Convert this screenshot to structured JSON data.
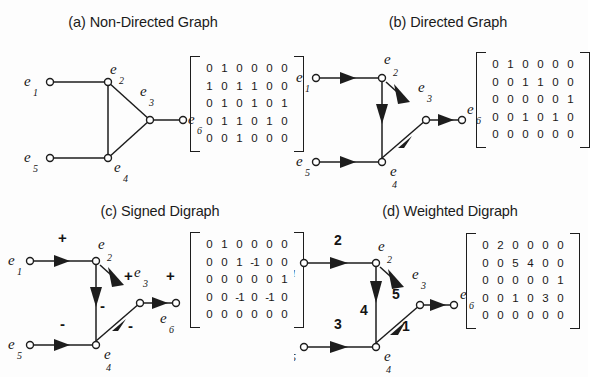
{
  "figure": {
    "background": "#fdfdfd",
    "stroke": "#1d1d1d",
    "panels": [
      {
        "id": "a",
        "title": "(a) Non-Directed Graph",
        "graph_type": "undirected",
        "nodes": [
          {
            "id": "e1",
            "label": "e",
            "sub": "1",
            "x": 50,
            "y": 52
          },
          {
            "id": "e2",
            "label": "e",
            "sub": "2",
            "x": 108,
            "y": 52
          },
          {
            "id": "e3",
            "label": "e",
            "sub": "3",
            "x": 150,
            "y": 90
          },
          {
            "id": "e4",
            "label": "e",
            "sub": "4",
            "x": 108,
            "y": 128
          },
          {
            "id": "e5",
            "label": "e",
            "sub": "5",
            "x": 50,
            "y": 128
          },
          {
            "id": "e6",
            "label": "e",
            "sub": "6",
            "x": 183,
            "y": 90
          }
        ],
        "edges": [
          {
            "from": "e1",
            "to": "e2",
            "label": ""
          },
          {
            "from": "e2",
            "to": "e3",
            "label": ""
          },
          {
            "from": "e2",
            "to": "e4",
            "label": ""
          },
          {
            "from": "e5",
            "to": "e4",
            "label": ""
          },
          {
            "from": "e4",
            "to": "e3",
            "label": ""
          },
          {
            "from": "e3",
            "to": "e6",
            "label": ""
          }
        ],
        "matrix": [
          [
            "0",
            "1",
            "0",
            "0",
            "0",
            "0"
          ],
          [
            "1",
            "0",
            "1",
            "1",
            "0",
            "0"
          ],
          [
            "0",
            "1",
            "0",
            "1",
            "0",
            "1"
          ],
          [
            "0",
            "1",
            "1",
            "0",
            "1",
            "0"
          ],
          [
            "0",
            "0",
            "1",
            "0",
            "0",
            "0"
          ]
        ]
      },
      {
        "id": "b",
        "title": "(b) Directed Graph",
        "graph_type": "directed",
        "nodes": [
          {
            "id": "e1",
            "label": "e",
            "sub": "1",
            "x": 22,
            "y": 48
          },
          {
            "id": "e2",
            "label": "e",
            "sub": "2",
            "x": 88,
            "y": 48
          },
          {
            "id": "e3",
            "label": "e",
            "sub": "3",
            "x": 132,
            "y": 90
          },
          {
            "id": "e4",
            "label": "e",
            "sub": "4",
            "x": 88,
            "y": 132
          },
          {
            "id": "e5",
            "label": "e",
            "sub": "5",
            "x": 22,
            "y": 132
          },
          {
            "id": "e6",
            "label": "e",
            "sub": "6",
            "x": 168,
            "y": 90
          }
        ],
        "edges": [
          {
            "from": "e1",
            "to": "e2",
            "label": ""
          },
          {
            "from": "e2",
            "to": "e3",
            "label": ""
          },
          {
            "from": "e2",
            "to": "e4",
            "label": ""
          },
          {
            "from": "e5",
            "to": "e4",
            "label": ""
          },
          {
            "from": "e4",
            "to": "e3",
            "label": ""
          },
          {
            "from": "e3",
            "to": "e6",
            "label": ""
          }
        ],
        "matrix": [
          [
            "0",
            "1",
            "0",
            "0",
            "0",
            "0"
          ],
          [
            "0",
            "0",
            "1",
            "1",
            "0",
            "0"
          ],
          [
            "0",
            "0",
            "0",
            "0",
            "0",
            "1"
          ],
          [
            "0",
            "0",
            "1",
            "0",
            "1",
            "0"
          ],
          [
            "0",
            "0",
            "0",
            "0",
            "0",
            "0"
          ]
        ]
      },
      {
        "id": "c",
        "title": "(c) Signed Digraph",
        "graph_type": "signed",
        "nodes": [
          {
            "id": "e1",
            "label": "e",
            "sub": "1",
            "x": 30,
            "y": 42
          },
          {
            "id": "e2",
            "label": "e",
            "sub": "2",
            "x": 96,
            "y": 42
          },
          {
            "id": "e3",
            "label": "e",
            "sub": "3",
            "x": 140,
            "y": 84
          },
          {
            "id": "e4",
            "label": "e",
            "sub": "4",
            "x": 96,
            "y": 126
          },
          {
            "id": "e5",
            "label": "e",
            "sub": "5",
            "x": 30,
            "y": 126
          },
          {
            "id": "e6",
            "label": "e",
            "sub": "6",
            "x": 176,
            "y": 84
          }
        ],
        "edges": [
          {
            "from": "e1",
            "to": "e2",
            "label": "+"
          },
          {
            "from": "e2",
            "to": "e3",
            "label": "+"
          },
          {
            "from": "e2",
            "to": "e4",
            "label": "-"
          },
          {
            "from": "e5",
            "to": "e4",
            "label": "-"
          },
          {
            "from": "e4",
            "to": "e3",
            "label": "-"
          },
          {
            "from": "e3",
            "to": "e6",
            "label": "+"
          }
        ],
        "matrix": [
          [
            "0",
            "1",
            "0",
            "0",
            "0",
            "0"
          ],
          [
            "0",
            "0",
            "1",
            "-1",
            "0",
            "0"
          ],
          [
            "0",
            "0",
            "0",
            "0",
            "0",
            "1"
          ],
          [
            "0",
            "0",
            "-1",
            "0",
            "-1",
            "0"
          ],
          [
            "0",
            "0",
            "0",
            "0",
            "0",
            "0"
          ]
        ]
      },
      {
        "id": "d",
        "title": "(d) Weighted Digraph",
        "graph_type": "weighted",
        "nodes": [
          {
            "id": "e1",
            "label": "e",
            "sub": "1",
            "x": 10,
            "y": 44
          },
          {
            "id": "e2",
            "label": "e",
            "sub": "2",
            "x": 82,
            "y": 44
          },
          {
            "id": "e3",
            "label": "e",
            "sub": "3",
            "x": 126,
            "y": 86
          },
          {
            "id": "e4",
            "label": "e",
            "sub": "4",
            "x": 82,
            "y": 128
          },
          {
            "id": "e5",
            "label": "e",
            "sub": "5",
            "x": 10,
            "y": 128
          },
          {
            "id": "e6",
            "label": "e",
            "sub": "6",
            "x": 160,
            "y": 86
          }
        ],
        "edges": [
          {
            "from": "e1",
            "to": "e2",
            "label": "2"
          },
          {
            "from": "e2",
            "to": "e3",
            "label": "5"
          },
          {
            "from": "e2",
            "to": "e4",
            "label": "4"
          },
          {
            "from": "e5",
            "to": "e4",
            "label": "3"
          },
          {
            "from": "e4",
            "to": "e3",
            "label": "1"
          },
          {
            "from": "e3",
            "to": "e6",
            "label": ""
          }
        ],
        "matrix": [
          [
            "0",
            "2",
            "0",
            "0",
            "0",
            "0"
          ],
          [
            "0",
            "0",
            "5",
            "4",
            "0",
            "0"
          ],
          [
            "0",
            "0",
            "0",
            "0",
            "0",
            "1"
          ],
          [
            "0",
            "0",
            "1",
            "0",
            "3",
            "0"
          ],
          [
            "0",
            "0",
            "0",
            "0",
            "0",
            "0"
          ]
        ]
      }
    ]
  }
}
